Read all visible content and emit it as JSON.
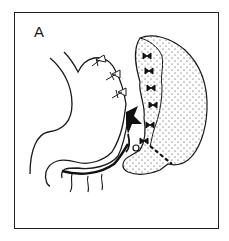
{
  "figure": {
    "panel_label": "A",
    "colors": {
      "line": "#1a1a1a",
      "background": "#ffffff",
      "stipple": "#333333"
    },
    "elements": [
      {
        "name": "stomach-outline"
      },
      {
        "name": "spleen-stippled-region"
      },
      {
        "name": "ligature-ties-greater-curvature",
        "count": 3
      },
      {
        "name": "ligature-ties-spleen-hilum",
        "count": 5
      },
      {
        "name": "splenic-vessel-dark-junction"
      },
      {
        "name": "dashed-resection-line"
      },
      {
        "name": "gastroepiploic-vessel-branches",
        "count": 3
      }
    ]
  }
}
